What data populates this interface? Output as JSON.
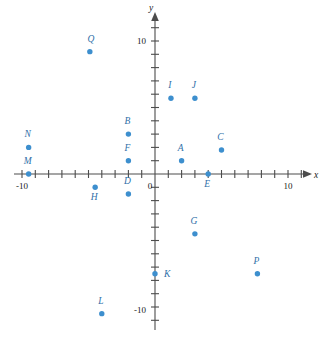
{
  "chart_data": {
    "type": "scatter",
    "title": "",
    "subtitle": "",
    "xlabel": "x",
    "ylabel": "y",
    "xlim": [
      -11,
      11
    ],
    "ylim": [
      -11,
      11
    ],
    "grid": false,
    "legend": "none",
    "axis_tick_interval": 1,
    "labeled_ticks": {
      "x": [
        "-10",
        "10"
      ],
      "y": [
        "10",
        "-10"
      ],
      "origin": "0"
    },
    "point_color": "#3d8fce",
    "axis_color": "#4c4c4c",
    "label_color": "#2f6fa8",
    "points": [
      {
        "label": "A",
        "x": 2,
        "y": 1,
        "label_dx": -1,
        "label_dy": -10
      },
      {
        "label": "B",
        "x": -2,
        "y": 3,
        "label_dx": -1,
        "label_dy": -10
      },
      {
        "label": "C",
        "x": 5,
        "y": 1.8,
        "label_dx": -1,
        "label_dy": -10
      },
      {
        "label": "D",
        "x": -2,
        "y": -1.5,
        "label_dx": -1,
        "label_dy": -10
      },
      {
        "label": "E",
        "x": 4,
        "y": 0,
        "label_dx": -1,
        "label_dy": 13
      },
      {
        "label": "F",
        "x": -2,
        "y": 1,
        "label_dx": -1,
        "label_dy": -10
      },
      {
        "label": "G",
        "x": 3,
        "y": -4.5,
        "label_dx": -1,
        "label_dy": -10
      },
      {
        "label": "H",
        "x": -4.5,
        "y": -1,
        "label_dx": -1,
        "label_dy": 13
      },
      {
        "label": "I",
        "x": 1.2,
        "y": 5.7,
        "label_dx": -1,
        "label_dy": -10
      },
      {
        "label": "J",
        "x": 3,
        "y": 5.7,
        "label_dx": -1,
        "label_dy": -10
      },
      {
        "label": "K",
        "x": 0,
        "y": -7.5,
        "label_dx": 9,
        "label_dy": 3
      },
      {
        "label": "L",
        "x": -4,
        "y": -10.5,
        "label_dx": -1,
        "label_dy": -10
      },
      {
        "label": "M",
        "x": -9.5,
        "y": 0,
        "label_dx": -1,
        "label_dy": -10
      },
      {
        "label": "N",
        "x": -9.5,
        "y": 2,
        "label_dx": -1,
        "label_dy": -10
      },
      {
        "label": "P",
        "x": 7.7,
        "y": -7.5,
        "label_dx": -1,
        "label_dy": -10
      },
      {
        "label": "Q",
        "x": -4.9,
        "y": 9.2,
        "label_dx": 1,
        "label_dy": -10
      }
    ]
  },
  "axes": {
    "x_axis_name": "x",
    "y_axis_name": "y",
    "origin_label": "0",
    "x_neg_label": "-10",
    "x_pos_label": "10",
    "y_pos_label": "10",
    "y_neg_label": "-10"
  }
}
